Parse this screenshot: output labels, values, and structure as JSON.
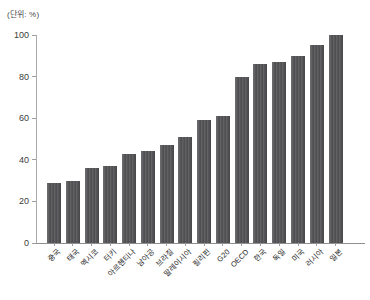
{
  "chart_data": {
    "type": "bar",
    "title": "",
    "unit_label": "(단위: %)",
    "categories": [
      "중국",
      "태국",
      "멕시코",
      "터키",
      "아르헨티나",
      "남아공",
      "브라질",
      "말레이시아",
      "필리핀",
      "G20",
      "OECD",
      "한국",
      "독일",
      "미국",
      "러시아",
      "일본"
    ],
    "values": [
      29,
      30,
      36,
      37,
      43,
      44,
      47,
      51,
      59,
      61,
      80,
      86,
      87,
      90,
      95,
      100
    ],
    "xlabel": "",
    "ylabel": "",
    "ylim": [
      0,
      100
    ],
    "yticks": [
      0,
      20,
      40,
      60,
      80,
      100
    ],
    "grid": false,
    "legend": false,
    "bar_color": "#58585a",
    "axis_color": "#9e9e9e",
    "label_color": "#262626"
  }
}
